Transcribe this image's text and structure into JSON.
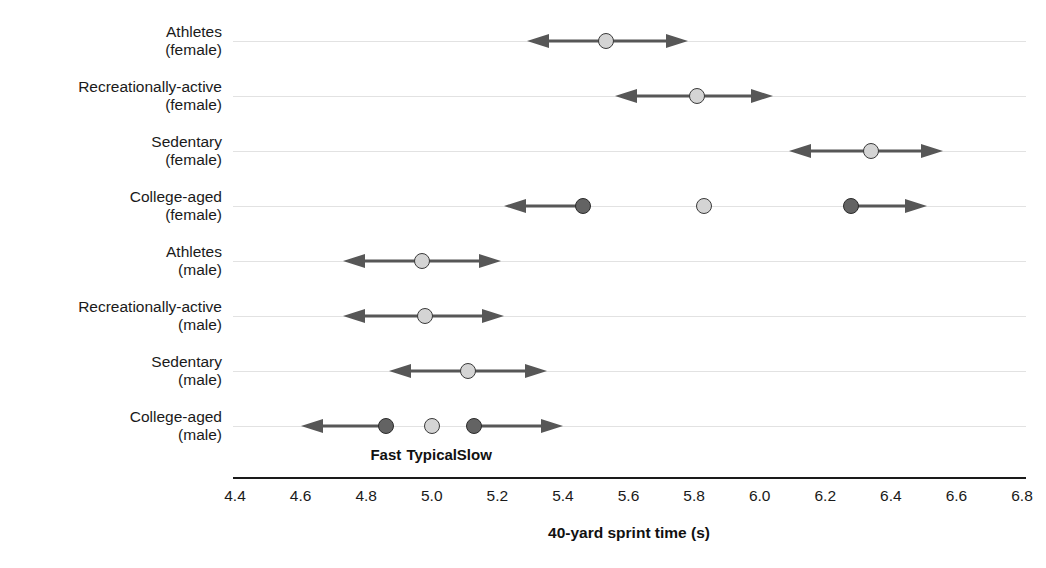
{
  "chart_data": {
    "type": "scatter",
    "title": "",
    "xlabel": "40-yard sprint time (s)",
    "ylabel": "",
    "xlim": [
      4.4,
      6.8
    ],
    "xticks": [
      "4.4",
      "4.6",
      "4.8",
      "5.0",
      "5.2",
      "5.4",
      "5.6",
      "5.8",
      "6.0",
      "6.2",
      "6.4",
      "6.6",
      "6.8"
    ],
    "xtick_values": [
      4.4,
      4.6,
      4.8,
      5.0,
      5.2,
      5.4,
      5.6,
      5.8,
      6.0,
      6.2,
      6.4,
      6.6,
      6.8
    ],
    "grid": true,
    "legend_position": "in-plot-bottom",
    "legend": [
      {
        "label": "Fast",
        "marker": "dark-dot",
        "x": 4.86
      },
      {
        "label": "Typical",
        "marker": "light-dot",
        "x": 5.0
      },
      {
        "label": "Slow",
        "marker": "dark-dot",
        "x": 5.13
      }
    ],
    "categories": [
      {
        "line1": "Athletes",
        "line2": "(female)"
      },
      {
        "line1": "Recreationally-active",
        "line2": "(female)"
      },
      {
        "line1": "Sedentary",
        "line2": "(female)"
      },
      {
        "line1": "College-aged",
        "line2": "(female)"
      },
      {
        "line1": "Athletes",
        "line2": "(male)"
      },
      {
        "line1": "Recreationally-active",
        "line2": "(male)"
      },
      {
        "line1": "Sedentary",
        "line2": "(male)"
      },
      {
        "line1": "College-aged",
        "line2": "(male)"
      }
    ],
    "series": [
      {
        "name": "Athletes (female)",
        "typical": 5.53,
        "fast": null,
        "slow": null,
        "range_low": 5.29,
        "range_high": 5.78,
        "arrow_left": true,
        "arrow_right": true
      },
      {
        "name": "Recreationally-active (female)",
        "typical": 5.81,
        "fast": null,
        "slow": null,
        "range_low": 5.56,
        "range_high": 6.04,
        "arrow_left": true,
        "arrow_right": true
      },
      {
        "name": "Sedentary (female)",
        "typical": 6.34,
        "fast": null,
        "slow": null,
        "range_low": 6.09,
        "range_high": 6.56,
        "arrow_left": true,
        "arrow_right": true
      },
      {
        "name": "College-aged (female)",
        "typical": 5.83,
        "fast": 5.46,
        "slow": 6.28,
        "range_low": 5.22,
        "range_high": 6.51,
        "arrow_left": true,
        "arrow_right": true
      },
      {
        "name": "Athletes (male)",
        "typical": 4.97,
        "fast": null,
        "slow": null,
        "range_low": 4.73,
        "range_high": 5.21,
        "arrow_left": true,
        "arrow_right": true
      },
      {
        "name": "Recreationally-active (male)",
        "typical": 4.98,
        "fast": null,
        "slow": null,
        "range_low": 4.73,
        "range_high": 5.22,
        "arrow_left": true,
        "arrow_right": true
      },
      {
        "name": "Sedentary (male)",
        "typical": 5.11,
        "fast": null,
        "slow": null,
        "range_low": 4.87,
        "range_high": 5.35,
        "arrow_left": true,
        "arrow_right": true
      },
      {
        "name": "College-aged (male)",
        "typical": 5.0,
        "fast": 4.86,
        "slow": 5.13,
        "range_low": 4.6,
        "range_high": 5.4,
        "arrow_left": true,
        "arrow_right": true
      }
    ],
    "colors": {
      "dot_typical": "#d4d4d4",
      "dot_extreme": "#636363",
      "line": "#575757",
      "grid": "#e2e2e2",
      "axis": "#1a1a1a",
      "text": "#1a1a1a"
    }
  },
  "geometry": {
    "x_left_px": 235,
    "x_right_px": 1022,
    "x_left_val": 4.4,
    "x_right_val": 6.8,
    "axis_line_x0": 233,
    "axis_line_x1": 1026,
    "axis_line_y": 477,
    "tick_label_y": 487,
    "axis_title_x": 629,
    "axis_title_y": 524,
    "legend_y": 446,
    "row_y": [
      41,
      96,
      151,
      206,
      261,
      316,
      371,
      426
    ],
    "row_label_top_offset": -18
  }
}
